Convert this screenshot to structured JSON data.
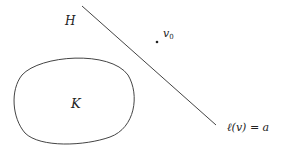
{
  "diagram": {
    "labels": {
      "halfspace": "H",
      "point": "v",
      "point_subscript": "0",
      "convex_set": "K",
      "hyperplane_ell": "ℓ",
      "hyperplane_rest": "(v) = a"
    },
    "colors": {
      "stroke": "#444444",
      "text": "#222222",
      "background": "#ffffff"
    }
  }
}
